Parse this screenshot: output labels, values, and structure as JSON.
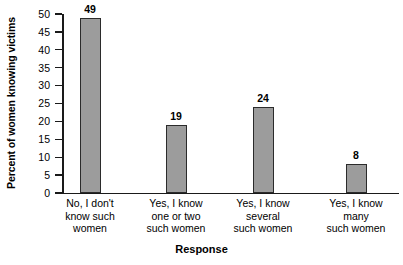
{
  "chart_data": {
    "type": "bar",
    "title": "",
    "xlabel": "Response",
    "ylabel": "Percent of women knowing victims",
    "categories": [
      "No, I don't\nknow such\nwomen",
      "Yes, I know\none or two\nsuch women",
      "Yes, I know\nseveral\nsuch women",
      "Yes, I know\nmany\nsuch women"
    ],
    "values": [
      49,
      19,
      24,
      8
    ],
    "value_labels": [
      "49",
      "19",
      "24",
      "8"
    ],
    "ylim": [
      0,
      50
    ],
    "ytick_labels": [
      "50",
      "45",
      "40",
      "35",
      "30",
      "25",
      "20",
      "15",
      "10",
      "5",
      "0"
    ],
    "ytick_values": [
      50,
      45,
      40,
      35,
      30,
      25,
      20,
      15,
      10,
      5,
      0
    ],
    "grid": false,
    "legend": "none",
    "bar_fill_color": "#9c9c9c",
    "bar_edge_color": "#2b2b2b",
    "axis_color": "#1a1a1a",
    "background_color": "#ffffff"
  }
}
